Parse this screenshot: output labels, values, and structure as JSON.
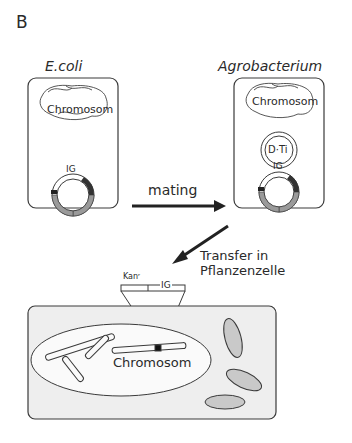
{
  "panel_label": "B",
  "organisms": {
    "ecoli": {
      "title": "E.coli",
      "chromosome_label": "Chromosom",
      "plasmid_label": "IG"
    },
    "agro": {
      "title": "Agrobacterium",
      "chromosome_label": "Chromosom",
      "ti_label": "D·Ti",
      "plasmid_label": "IG"
    }
  },
  "arrows": {
    "mating_label": "mating",
    "transfer_label_line1": "Transfer in",
    "transfer_label_line2": "Pflanzenzelle"
  },
  "insert": {
    "kan_label": "Kanʳ",
    "ig_label": "IG"
  },
  "plant_cell": {
    "chromosome_label": "Chromosom"
  },
  "colors": {
    "line": "#3a3a3a",
    "segment_gray": "#9a9a9a",
    "cell_fill": "#eeeeee",
    "organelle_fill": "#c9c9c9"
  }
}
